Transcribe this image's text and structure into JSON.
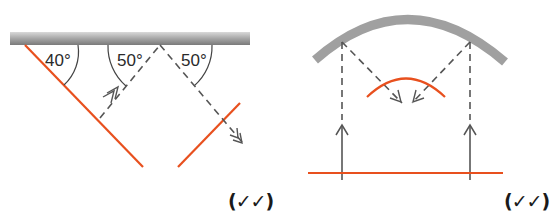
{
  "left_diagram": {
    "description": "Plane mirror reflection with two orange plane mirrors",
    "angles": [
      "40°",
      "50°",
      "50°"
    ],
    "marks": "(✓✓)"
  },
  "right_diagram": {
    "description": "Curved (convex) reflector focusing parallel rays onto an orange arc",
    "marks": "(✓✓)"
  },
  "colors": {
    "mirror": "#8c8c8c",
    "object_line": "#e8501e",
    "ray": "#555555",
    "text": "#2a2a2a"
  }
}
